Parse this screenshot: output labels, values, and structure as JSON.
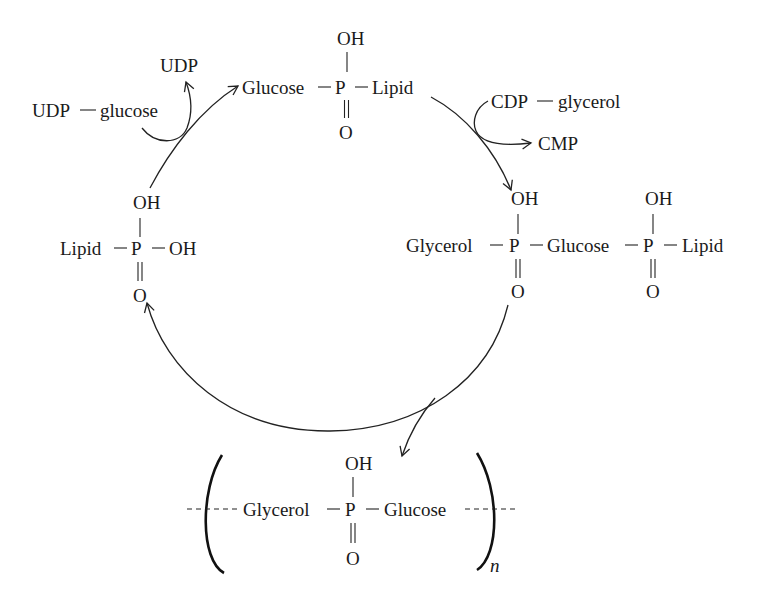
{
  "diagram": {
    "type": "biosynthesis-cycle",
    "nodes": {
      "top": {
        "left": "Glucose",
        "center": "P",
        "right": "Lipid",
        "up": "OH",
        "down": "O"
      },
      "left": {
        "left": "Lipid",
        "center": "P",
        "right": "OH",
        "up": "OH",
        "down": "O"
      },
      "right": {
        "group1": "Glycerol",
        "p1": "P",
        "group2": "Glucose",
        "p2": "P",
        "group3": "Lipid",
        "p1_up": "OH",
        "p1_down": "O",
        "p2_up": "OH",
        "p2_down": "O"
      },
      "product": {
        "left": "Glycerol",
        "center": "P",
        "right": "Glucose",
        "up": "OH",
        "down": "O",
        "repeat_subscript": "n"
      }
    },
    "side_reactions": {
      "udp_glucose": {
        "input_a": "UDP",
        "input_b": "glucose",
        "output": "UDP"
      },
      "cdp_glycerol": {
        "input_a": "CDP",
        "input_b": "glycerol",
        "output": "CMP"
      }
    },
    "edges": [
      {
        "from": "left",
        "to": "top",
        "reagent": "UDP-glucose",
        "releases": "UDP"
      },
      {
        "from": "top",
        "to": "right",
        "reagent": "CDP-glycerol",
        "releases": "CMP"
      },
      {
        "from": "right",
        "to": "left",
        "releases": "product polymer"
      },
      {
        "from": "right",
        "to": "product"
      }
    ],
    "bond_symbol": "—"
  }
}
